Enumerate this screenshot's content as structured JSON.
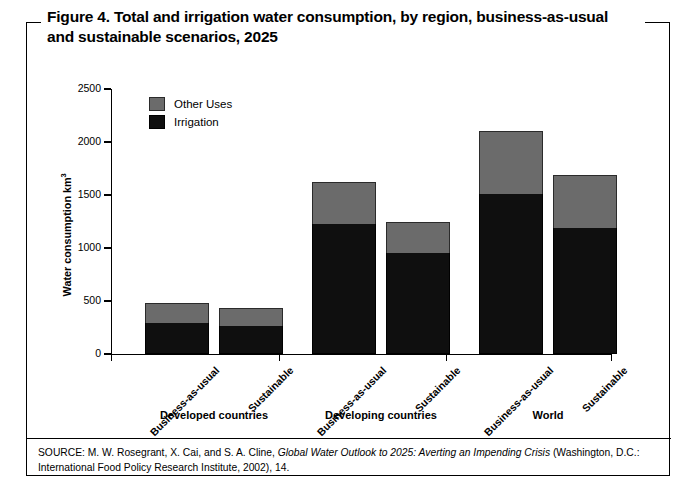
{
  "figure": {
    "title_line1": "Figure 4. Total and irrigation water consumption, by region, business-as-usual",
    "title_line2": "and sustainable scenarios, 2025"
  },
  "legend": {
    "position": "inside-top-left",
    "entries": [
      {
        "label": "Other Uses",
        "color": "#6b6b6b",
        "icon": "square-swatch-icon"
      },
      {
        "label": "Irrigation",
        "color": "#0f0f0f",
        "icon": "square-swatch-icon"
      }
    ]
  },
  "source": {
    "prefix": "SOURCE: M. W. Rosegrant, X. Cai, and S. A. Cline, ",
    "italic_title": "Global Water Outlook to 2025: Averting an Impending Crisis",
    "suffix": " (Washington, D.C.: International Food Policy Research Institute, 2002), 14."
  },
  "chart_data": {
    "type": "bar",
    "stacked": true,
    "title": "Figure 4. Total and irrigation water consumption, by region, business-as-usual and sustainable scenarios, 2025",
    "xlabel": "",
    "ylabel": "Water consumption km³",
    "ylim": [
      0,
      2500
    ],
    "yticks": [
      0,
      500,
      1000,
      1500,
      2000,
      2500
    ],
    "ytick_labels": [
      "0",
      "500",
      "1000",
      "1500",
      "2000",
      "2500"
    ],
    "grid": false,
    "groups": [
      "Developed countries",
      "Developing countries",
      "World"
    ],
    "categories": [
      "Business-as-usual",
      "Sustainable",
      "Business-as-usual",
      "Sustainable",
      "Business-as-usual",
      "Sustainable"
    ],
    "series": [
      {
        "name": "Irrigation",
        "color": "#0f0f0f",
        "values": [
          295,
          265,
          1230,
          950,
          1505,
          1185
        ]
      },
      {
        "name": "Other Uses",
        "color": "#6b6b6b",
        "values": [
          185,
          170,
          390,
          300,
          595,
          505
        ]
      }
    ],
    "totals": [
      480,
      435,
      1620,
      1250,
      2100,
      1690
    ]
  }
}
